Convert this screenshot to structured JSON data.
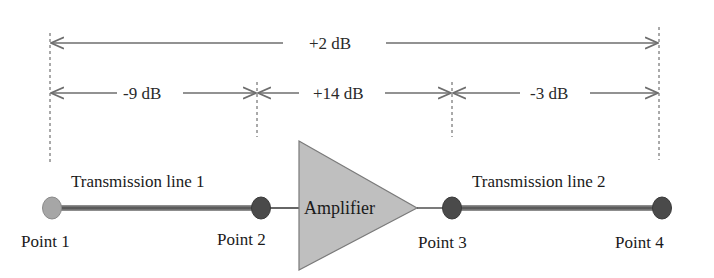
{
  "diagram": {
    "type": "signal-chain-gain-diagram",
    "total_gain": {
      "label": "+2 dB",
      "from": "Point 1",
      "to": "Point 4"
    },
    "segments": [
      {
        "label": "-9 dB",
        "from": "Point 1",
        "to": "Point 2"
      },
      {
        "label": "+14 dB",
        "from": "Point 2",
        "to": "Point 3"
      },
      {
        "label": "-3 dB",
        "from": "Point 3",
        "to": "Point 4"
      }
    ],
    "components": [
      {
        "name": "Transmission line 1",
        "label": "Transmission line 1"
      },
      {
        "name": "Amplifier",
        "label": "Amplifier"
      },
      {
        "name": "Transmission line 2",
        "label": "Transmission line 2"
      }
    ],
    "points": [
      {
        "label": "Point 1",
        "color": "#a6a6a6"
      },
      {
        "label": "Point 2",
        "color": "#4a4a4a"
      },
      {
        "label": "Point 3",
        "color": "#4a4a4a"
      },
      {
        "label": "Point 4",
        "color": "#4a4a4a"
      }
    ],
    "colors": {
      "arrow": "#6e6e6e",
      "guide_dashed": "#555555",
      "line": "#5a5a5a",
      "amplifier_fill": "#bfbfbf",
      "amplifier_stroke": "#7a7a7a"
    }
  }
}
